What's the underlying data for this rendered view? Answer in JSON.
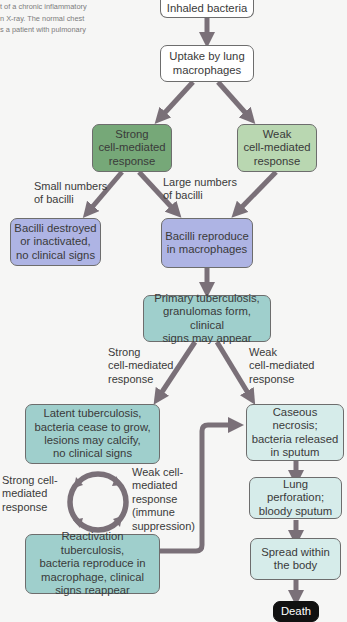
{
  "caption": {
    "lines": [
      "t of a chronic inflammatory",
      "n X-ray. The normal chest",
      "s a patient with pulmonary"
    ]
  },
  "flowchart": {
    "colors": {
      "white_box": "#ffffff",
      "strong_green": "#76a878",
      "weak_green": "#b9d7b1",
      "lavender": "#aeb4e4",
      "teal": "#9fcfcc",
      "light_teal": "#d6ecea",
      "death": "#111111",
      "arrow": "#7a7078"
    },
    "nodes": {
      "inhaled": "Inhaled bacteria",
      "uptake": "Uptake by lung\nmacrophages",
      "strong": "Strong\ncell-mediated\nresponse",
      "weak": "Weak\ncell-mediated\nresponse",
      "destroyed": "Bacilli destroyed\nor inactivated,\nno clinical signs",
      "reproduce": "Bacilli reproduce\nin macrophages",
      "primary": "Primary tuberculosis,\ngranulomas form, clinical\nsigns may appear",
      "latent": "Latent tuberculosis,\nbacteria cease to grow,\nlesions may calcify,\nno clinical signs",
      "reactivation": "Reactivation tuberculosis,\nbacteria reproduce in\nmacrophage, clinical\nsigns reappear",
      "caseous": "Caseous necrosis;\nbacteria released\nin sputum",
      "perforation": "Lung perforation;\nbloody sputum",
      "spread": "Spread within\nthe body",
      "death": "Death"
    },
    "edge_labels": {
      "small_numbers": "Small numbers\nof bacilli",
      "large_numbers": "Large numbers\nof bacilli",
      "strong_cmr": "Strong\ncell-mediated\nresponse",
      "weak_cmr": "Weak\ncell-mediated\nresponse",
      "strong_cycle": "Strong cell-\nmediated\nresponse",
      "weak_cycle": "Weak cell-\nmediated\nresponse\n(immune\nsuppression)"
    }
  }
}
